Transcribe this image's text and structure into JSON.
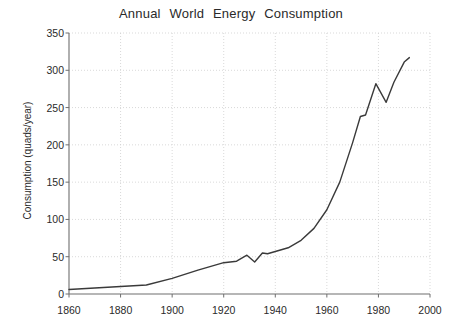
{
  "chart_data": {
    "type": "line",
    "title": "Annual  World  Energy  Consumption",
    "xlabel": "",
    "ylabel": "Consumption (quads/year)",
    "xlim": [
      1860,
      2000
    ],
    "ylim": [
      0,
      350
    ],
    "xticks": [
      1860,
      1880,
      1900,
      1920,
      1940,
      1960,
      1980,
      2000
    ],
    "xtick_labels": [
      "1860",
      "1880",
      "1900",
      "1920",
      "1940",
      "1960",
      "1980",
      "2000"
    ],
    "yticks": [
      0,
      50,
      100,
      150,
      200,
      250,
      300,
      350
    ],
    "ytick_labels": [
      "0",
      "50",
      "100",
      "150",
      "200",
      "250",
      "300",
      "350"
    ],
    "grid": true,
    "grid_style": "dotted",
    "grid_color": "#cfcfcf",
    "legend": false,
    "line_color": "#3a3a3a",
    "line_width": 1.4,
    "series": [
      {
        "name": "World energy consumption",
        "x": [
          1860,
          1870,
          1880,
          1890,
          1900,
          1910,
          1920,
          1925,
          1929,
          1932,
          1935,
          1937,
          1940,
          1945,
          1950,
          1955,
          1960,
          1965,
          1970,
          1973,
          1975,
          1979,
          1983,
          1986,
          1990,
          1992
        ],
        "y": [
          6,
          8,
          10,
          12,
          21,
          32,
          42,
          44,
          52,
          43,
          55,
          54,
          57,
          62,
          72,
          88,
          113,
          150,
          203,
          238,
          240,
          282,
          257,
          284,
          311,
          317
        ]
      }
    ]
  }
}
